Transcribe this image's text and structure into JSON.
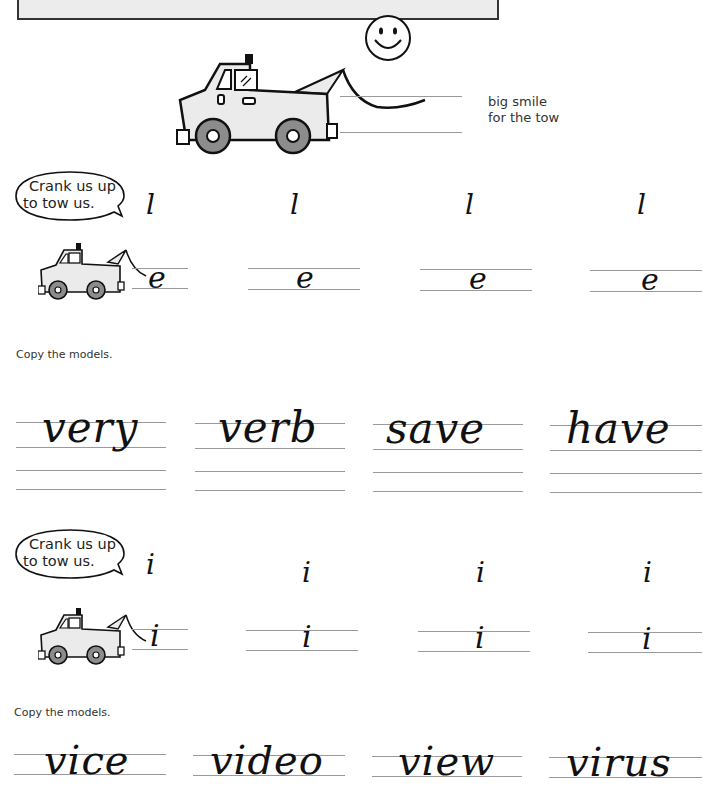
{
  "header": {
    "title_box": ""
  },
  "hero": {
    "caption_line1": "big smile",
    "caption_line2": "for the tow",
    "illustration": "tow-truck-with-smiley-hook"
  },
  "section_e": {
    "bubble_line1": "Crank us up",
    "bubble_line2": "to tow us.",
    "model_letter": "l",
    "models": [
      "l",
      "l",
      "l",
      "l"
    ],
    "traced_letters": [
      "e",
      "e",
      "e",
      "e"
    ]
  },
  "words_e": {
    "instruction": "Copy the models.",
    "words": [
      "very",
      "verb",
      "save",
      "have"
    ]
  },
  "section_i": {
    "bubble_line1": "Crank us up",
    "bubble_line2": "to tow us.",
    "models": [
      "i",
      "i",
      "i",
      "i"
    ],
    "traced_letters": [
      "i",
      "i",
      "i",
      "i"
    ]
  },
  "words_i": {
    "instruction": "Copy the models.",
    "words": [
      "vice",
      "video",
      "view",
      "virus"
    ]
  },
  "colors": {
    "header_fill": "#ececec",
    "truck_fill": "#ebebeb",
    "wheel_gray": "#8c8c8c",
    "guide_line": "#9a9a9a",
    "ink": "#111111"
  }
}
